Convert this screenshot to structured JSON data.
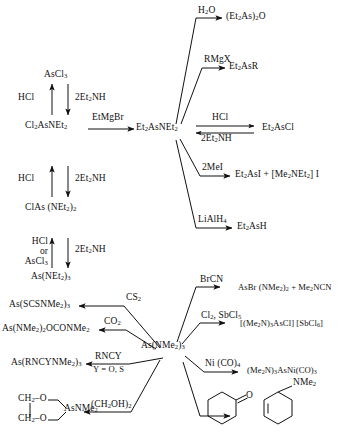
{
  "figure": {
    "type": "reaction-scheme",
    "title": "",
    "schemes": [
      {
        "id": "scheme-top",
        "center_node": "Et2AsNEt2",
        "description": "Aminoarsine synthesis and reactions of Et2AsNEt2"
      },
      {
        "id": "scheme-bottom",
        "center_node": "As(NMe2)3",
        "description": "Reactions of tris(dimethylamino)arsine"
      }
    ]
  },
  "top": {
    "ladder": {
      "n0": "AsCl<sub>3</sub>",
      "n1": "Cl<sub>2</sub>AsNEt<sub>2</sub>",
      "n2": "ClAs (NEt<sub>2</sub>)<sub>2</sub>",
      "n3": "As(NEt<sub>2</sub>)<sub>3</sub>",
      "up1": "HCl",
      "up2": "HCl",
      "up3_l1": "HCl",
      "up3_l2": "or",
      "up3_l3": "AsCl<sub>3</sub>",
      "dn1": "2Et<sub>2</sub>NH",
      "dn2": "2Et<sub>2</sub>NH",
      "dn3": "2Et<sub>2</sub>NH"
    },
    "bridge_reagent": "EtMgBr",
    "center": "Et<sub>2</sub>AsNEt<sub>2</sub>",
    "branches": [
      {
        "reagent": "H<sub>2</sub>O",
        "product": "(Et<sub>2</sub>As)<sub>2</sub>O"
      },
      {
        "reagent": "RMgX",
        "product": "Et<sub>2</sub>AsR"
      },
      {
        "reagent": "HCl",
        "reagent_back": "2Et<sub>2</sub>NH",
        "product": "Et<sub>2</sub>AsCl"
      },
      {
        "reagent": "2MeI",
        "product": "Et<sub>2</sub>AsI + [Me<sub>2</sub>NEt<sub>2</sub>] I"
      },
      {
        "reagent": "LiAlH<sub>4</sub>",
        "product": "Et<sub>2</sub>AsH"
      }
    ]
  },
  "bottom": {
    "center": "As(NMe<sub>2</sub>)<sub>3</sub>",
    "left_branches": [
      {
        "reagent": "CS<sub>2</sub>",
        "reagent2": "",
        "product": "As(SCSNMe<sub>2</sub>)<sub>3</sub>"
      },
      {
        "reagent": "CO<sub>2</sub>",
        "reagent2": "",
        "product": "As(NMe<sub>2</sub>)<sub>2</sub>OCONMe<sub>2</sub>"
      },
      {
        "reagent": "RNCY",
        "reagent2": "Y = O, S",
        "product": "As(RNCYNMe<sub>2</sub>)<sub>3</sub>"
      },
      {
        "reagent": "(CH<sub>2</sub>OH)<sub>2</sub>",
        "reagent2": "",
        "product": "dioxarsolane"
      }
    ],
    "dioxarsolane": {
      "l1": "CH<sub>2</sub>–O",
      "l2": "CH<sub>2</sub>–O",
      "bond": "|",
      "as": "AsNMe<sub>2</sub>"
    },
    "right_branches": [
      {
        "reagent": "BrCN",
        "product": "AsBr (NMe<sub>2</sub>)<sub>2</sub> +  Me<sub>2</sub>NCN"
      },
      {
        "reagent": "Cl<sub>2</sub>, SbCl<sub>5</sub>",
        "product": "[(Me<sub>2</sub>N)<sub>3</sub>AsCl] [SbCl<sub>6</sub>]"
      },
      {
        "reagent": "Ni (CO)<sub>4</sub>",
        "product": "(Me<sub>2</sub>N)<sub>3</sub>AsNi(CO)<sub>3</sub>"
      },
      {
        "reagent": "cyclohexanone",
        "product": "1-(N,N-dimethylamino)cyclohexene"
      }
    ],
    "cyclohexanone_oxygen": "O",
    "enamine_label": "NMe<sub>2</sub>"
  },
  "colors": {
    "ink": "#111111",
    "paper": "#ffffff"
  }
}
